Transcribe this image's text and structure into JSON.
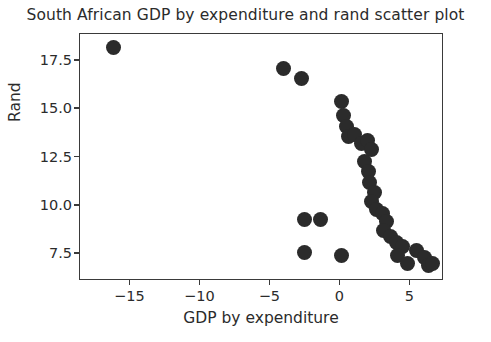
{
  "chart_data": {
    "type": "scatter",
    "title": "South African GDP by expenditure and rand scatter plot",
    "xlabel": "GDP by expenditure",
    "ylabel": "Rand",
    "xlim": [
      -18.6,
      7.4
    ],
    "ylim": [
      6.1,
      18.9
    ],
    "xticks": [
      -15,
      -10,
      -5,
      0,
      5
    ],
    "xtick_labels": [
      "−15",
      "−10",
      "−5",
      "0",
      "5"
    ],
    "yticks": [
      7.5,
      10.0,
      12.5,
      15.0,
      17.5
    ],
    "ytick_labels": [
      "7.5",
      "10.0",
      "12.5",
      "15.0",
      "17.5"
    ],
    "grid": false,
    "legend": null,
    "marker": {
      "color": "#2b2b2b",
      "shape": "circle",
      "size_px": 15
    },
    "series": [
      {
        "name": "observations",
        "points": [
          [
            -16.2,
            18.2
          ],
          [
            -4.1,
            17.1
          ],
          [
            -2.8,
            16.6
          ],
          [
            -2.6,
            9.3
          ],
          [
            -1.4,
            9.3
          ],
          [
            -2.6,
            7.6
          ],
          [
            0.1,
            7.4
          ],
          [
            0.1,
            15.4
          ],
          [
            0.2,
            14.7
          ],
          [
            0.4,
            14.1
          ],
          [
            0.6,
            13.6
          ],
          [
            1.0,
            13.7
          ],
          [
            1.5,
            13.2
          ],
          [
            1.9,
            13.4
          ],
          [
            2.2,
            12.9
          ],
          [
            1.7,
            12.3
          ],
          [
            2.0,
            11.8
          ],
          [
            2.1,
            11.2
          ],
          [
            2.4,
            10.7
          ],
          [
            2.2,
            10.2
          ],
          [
            2.6,
            9.8
          ],
          [
            3.0,
            9.6
          ],
          [
            3.3,
            9.2
          ],
          [
            3.1,
            8.7
          ],
          [
            3.6,
            8.4
          ],
          [
            4.0,
            8.1
          ],
          [
            4.4,
            7.9
          ],
          [
            4.1,
            7.4
          ],
          [
            4.8,
            7.0
          ],
          [
            5.4,
            7.7
          ],
          [
            6.0,
            7.3
          ],
          [
            6.3,
            6.9
          ],
          [
            6.6,
            7.0
          ]
        ]
      }
    ]
  }
}
